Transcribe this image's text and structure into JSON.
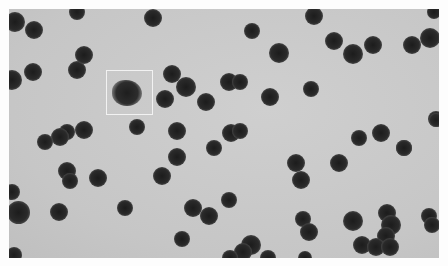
{
  "image": {
    "description": "Grayscale micrograph of dark spherical particles on a light gray background; one irregular fuzzy particle is highlighted by a white square box.",
    "colors": {
      "background": "#c9c9c9",
      "particle": "#222222",
      "highlight_box": "#f2f2f2",
      "margin": "#fdfdfd"
    },
    "highlight_box": {
      "x": 106,
      "y": 70,
      "width": 47,
      "height": 45
    },
    "fuzzy_particle": {
      "x": 127,
      "y": 95,
      "r": 14
    },
    "particles": [
      [
        77,
        12,
        7
      ],
      [
        34,
        30,
        8
      ],
      [
        15,
        22,
        9
      ],
      [
        153,
        18,
        8
      ],
      [
        33,
        72,
        8
      ],
      [
        77,
        70,
        8
      ],
      [
        84,
        55,
        8
      ],
      [
        12,
        80,
        9
      ],
      [
        172,
        74,
        8
      ],
      [
        186,
        87,
        9
      ],
      [
        165,
        99,
        8
      ],
      [
        206,
        102,
        8
      ],
      [
        229,
        82,
        8
      ],
      [
        240,
        82,
        7
      ],
      [
        252,
        31,
        7
      ],
      [
        279,
        53,
        9
      ],
      [
        270,
        97,
        8
      ],
      [
        314,
        16,
        8
      ],
      [
        334,
        41,
        8
      ],
      [
        353,
        54,
        9
      ],
      [
        373,
        45,
        8
      ],
      [
        412,
        45,
        8
      ],
      [
        430,
        38,
        9
      ],
      [
        311,
        89,
        7
      ],
      [
        137,
        127,
        7
      ],
      [
        84,
        130,
        8
      ],
      [
        67,
        132,
        7
      ],
      [
        60,
        137,
        8
      ],
      [
        45,
        142,
        7
      ],
      [
        177,
        131,
        8
      ],
      [
        231,
        133,
        8
      ],
      [
        240,
        131,
        7
      ],
      [
        214,
        148,
        7
      ],
      [
        359,
        138,
        7
      ],
      [
        381,
        133,
        8
      ],
      [
        404,
        148,
        7
      ],
      [
        436,
        119,
        7
      ],
      [
        177,
        157,
        8
      ],
      [
        67,
        171,
        8
      ],
      [
        70,
        181,
        7
      ],
      [
        98,
        178,
        8
      ],
      [
        162,
        176,
        8
      ],
      [
        12,
        192,
        7
      ],
      [
        18,
        212,
        10
      ],
      [
        59,
        212,
        8
      ],
      [
        125,
        208,
        7
      ],
      [
        193,
        208,
        8
      ],
      [
        209,
        216,
        8
      ],
      [
        229,
        200,
        7
      ],
      [
        182,
        239,
        7
      ],
      [
        251,
        245,
        9
      ],
      [
        243,
        252,
        8
      ],
      [
        296,
        163,
        8
      ],
      [
        301,
        180,
        8
      ],
      [
        339,
        163,
        8
      ],
      [
        404,
        148,
        7
      ],
      [
        303,
        219,
        7
      ],
      [
        309,
        232,
        8
      ],
      [
        353,
        221,
        9
      ],
      [
        387,
        213,
        8
      ],
      [
        391,
        225,
        9
      ],
      [
        386,
        236,
        8
      ],
      [
        429,
        216,
        7
      ],
      [
        432,
        225,
        7
      ],
      [
        362,
        245,
        8
      ],
      [
        376,
        247,
        8
      ],
      [
        390,
        247,
        8
      ],
      [
        230,
        258,
        7
      ],
      [
        268,
        258,
        7
      ],
      [
        305,
        258,
        6
      ],
      [
        14,
        255,
        7
      ],
      [
        434,
        12,
        6
      ],
      [
        436,
        120,
        6
      ]
    ]
  }
}
